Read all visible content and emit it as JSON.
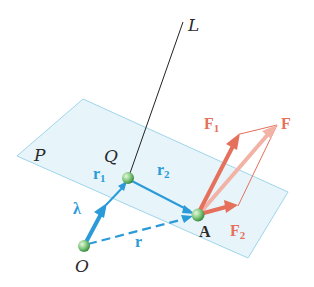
{
  "diagram": {
    "plane_label": "P",
    "line_label": "L",
    "points": {
      "origin": "O",
      "point_on_line": "Q",
      "point_of_application": "A"
    },
    "vectors": {
      "unit": "λ",
      "r1": {
        "base": "r",
        "sub": "1"
      },
      "r2": {
        "base": "r",
        "sub": "2"
      },
      "r": "r",
      "F": "F",
      "F1": {
        "base": "F",
        "sub": "1"
      },
      "F2": {
        "base": "F",
        "sub": "2"
      }
    },
    "colors": {
      "plane_fill": "#e3f3fa",
      "plane_edge": "#9fd5ea",
      "position_vectors": "#2a9ad8",
      "forces": "#e5705c",
      "force_resultant": "#f2b3a6",
      "points": "#7cc47c"
    }
  }
}
